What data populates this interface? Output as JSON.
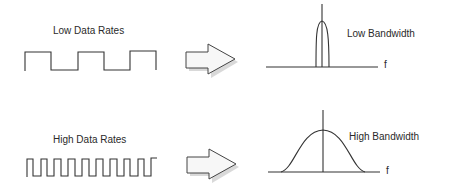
{
  "rows": [
    {
      "signal_label": "Low Data Rates",
      "spectrum_label": "Low Bandwidth",
      "axis_label": "f"
    },
    {
      "signal_label": "High Data Rates",
      "spectrum_label": "High Bandwidth",
      "axis_label": "f"
    }
  ],
  "colors": {
    "stroke": "#333333",
    "arrow_fill": "#f7f7f7",
    "arrow_shadow": "#c8c8c8",
    "background": "#ffffff"
  }
}
